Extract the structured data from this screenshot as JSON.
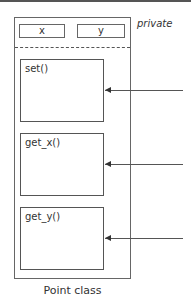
{
  "diagram": {
    "class_name": "Point class",
    "visibility_label": "private",
    "fields": [
      {
        "label": "x"
      },
      {
        "label": "y"
      }
    ],
    "methods": [
      {
        "label": "set()"
      },
      {
        "label": "get_x()"
      },
      {
        "label": "get_y()"
      }
    ],
    "arrows": [
      "incoming-call-set",
      "incoming-call-get_x",
      "incoming-call-get_y"
    ]
  }
}
